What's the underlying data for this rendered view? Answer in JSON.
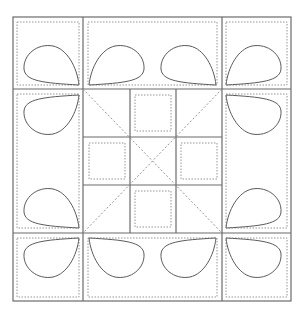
{
  "diagram": {
    "outer": {
      "x1": 13,
      "y1": 17,
      "x2": 291,
      "y2": 301
    },
    "columns": [
      13,
      83,
      222,
      291
    ],
    "rows": [
      17,
      89,
      233,
      301
    ],
    "center_grid": {
      "xs": [
        83,
        130,
        176,
        222
      ],
      "ys": [
        89,
        137,
        185,
        233
      ]
    },
    "colors": {
      "line": "#6b6b6b",
      "dotted": "#8a8a8a",
      "petal": "#5a5a5a",
      "background": "#ffffff"
    },
    "petal_count": 12,
    "center_squares": 4
  }
}
